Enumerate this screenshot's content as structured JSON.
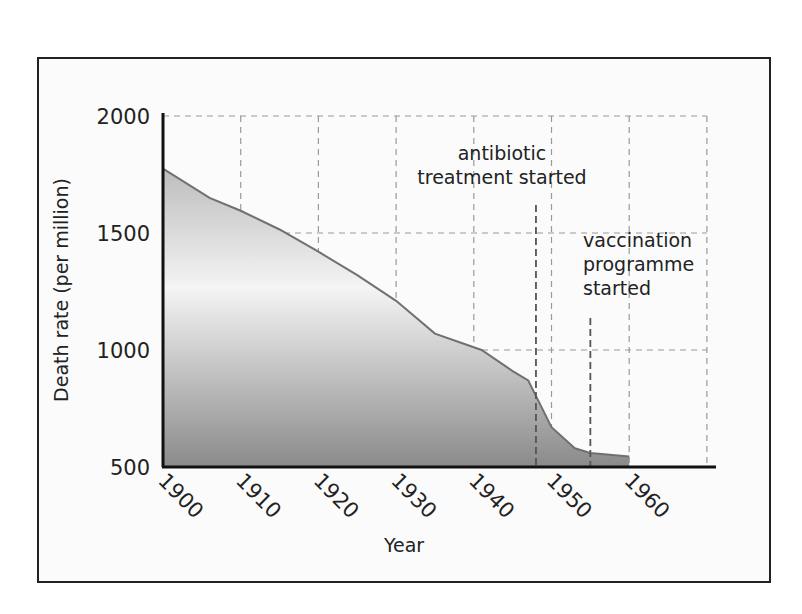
{
  "chart_data": {
    "type": "area",
    "title": "",
    "xlabel": "Year",
    "ylabel": "Death rate (per million)",
    "xlim": [
      1900,
      1970
    ],
    "ylim": [
      500,
      2000
    ],
    "grid": true,
    "x_ticks": [
      "1900",
      "1910",
      "1920",
      "1930",
      "1940",
      "1950",
      "1960"
    ],
    "y_ticks": [
      "2000",
      "1500",
      "1000",
      "500"
    ],
    "series": [
      {
        "name": "Death rate",
        "x": [
          1900,
          1906,
          1910,
          1915,
          1920,
          1925,
          1930,
          1935,
          1941,
          1945,
          1947,
          1950,
          1953,
          1955,
          1960
        ],
        "values": [
          1775,
          1650,
          1595,
          1515,
          1420,
          1320,
          1210,
          1070,
          1000,
          910,
          870,
          670,
          580,
          560,
          545
        ]
      }
    ],
    "annotations": [
      {
        "year": 1948,
        "text_lines": [
          "antibiotic",
          "treatment started"
        ]
      },
      {
        "year": 1955,
        "text_lines": [
          "vaccination",
          "programme",
          "started"
        ]
      }
    ],
    "colors": {
      "line": "#707070",
      "fill_top": "#c8c8c8",
      "fill_mid": "#f2f2f2",
      "fill_bottom": "#8c8c8c",
      "grid": "#9a9a9a",
      "axis": "#111111"
    }
  }
}
